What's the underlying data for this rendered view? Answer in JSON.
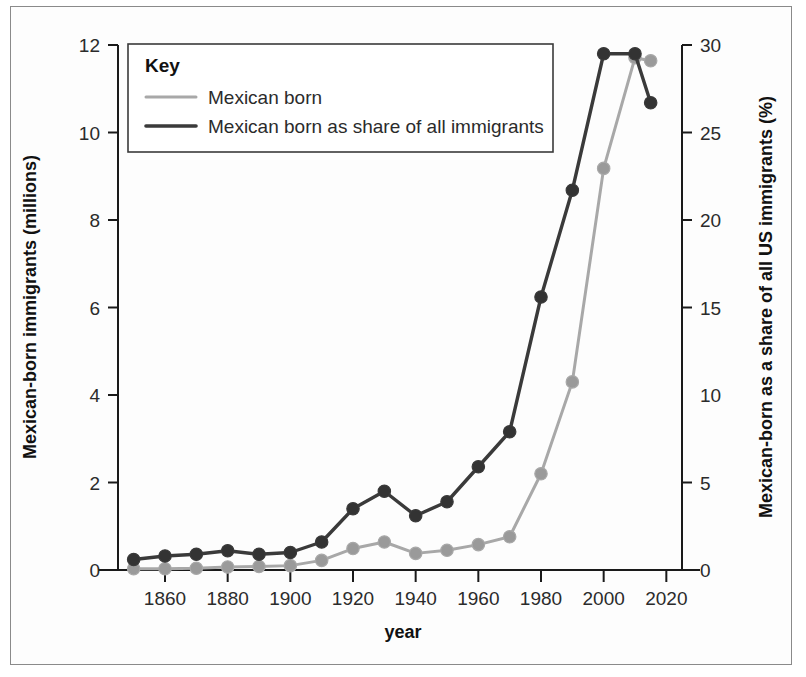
{
  "figure": {
    "background_color": "#ffffff",
    "frame_color": "#8a8a8a"
  },
  "legend": {
    "title": "Key",
    "entries": [
      {
        "label": "Mexican born",
        "color": "#a8a8a8"
      },
      {
        "label": "Mexican born as share of all immigrants",
        "color": "#3a3a3a"
      }
    ]
  },
  "axes": {
    "x_title": "year",
    "y_left_title": "Mexican-born immigrants (millions)",
    "y_right_title": "Mexican-born as a share of all US immigrants (%)",
    "x_ticks": [
      "1860",
      "1880",
      "1900",
      "1920",
      "1940",
      "1960",
      "1980",
      "2000",
      "2020"
    ],
    "y_left_ticks": [
      "0",
      "2",
      "4",
      "6",
      "8",
      "10",
      "12"
    ],
    "y_right_ticks": [
      "0",
      "5",
      "10",
      "15",
      "20",
      "25",
      "30"
    ]
  },
  "chart_data": {
    "type": "line",
    "title": "",
    "xlabel": "year",
    "ylabel": "Mexican-born immigrants (millions)",
    "ylabel_secondary": "Mexican-born as a share of all US immigrants (%)",
    "xlim": [
      1845,
      2025
    ],
    "ylim": [
      0,
      12
    ],
    "ylim_secondary": [
      0,
      30
    ],
    "grid": false,
    "legend_position": "top-left",
    "x": [
      1850,
      1860,
      1870,
      1880,
      1890,
      1900,
      1910,
      1920,
      1930,
      1940,
      1950,
      1960,
      1970,
      1980,
      1990,
      2000,
      2010,
      2015
    ],
    "series": [
      {
        "name": "Mexican born",
        "axis": "left",
        "unit": "millions",
        "color": "#a8a8a8",
        "marker_color": "#9a9a9a",
        "values": [
          0.03,
          0.03,
          0.04,
          0.07,
          0.08,
          0.1,
          0.22,
          0.49,
          0.64,
          0.38,
          0.45,
          0.58,
          0.76,
          2.2,
          4.3,
          9.18,
          11.71,
          11.64
        ]
      },
      {
        "name": "Mexican born as share of all immigrants",
        "axis": "right",
        "unit": "%",
        "color": "#3a3a3a",
        "marker_color": "#333333",
        "values": [
          0.6,
          0.8,
          0.9,
          1.1,
          0.9,
          1.0,
          1.6,
          3.5,
          4.5,
          3.1,
          3.9,
          5.9,
          7.9,
          15.6,
          21.7,
          29.5,
          29.5,
          26.7
        ]
      }
    ]
  }
}
